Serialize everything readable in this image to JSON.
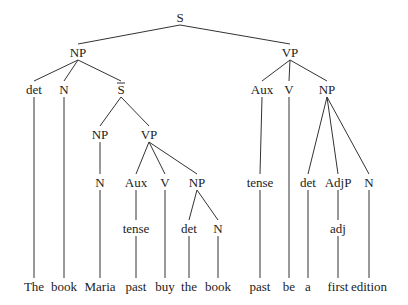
{
  "diagram": {
    "type": "syntax-tree",
    "sentence": [
      "The",
      "book",
      "Maria",
      "past",
      "buy",
      "the",
      "book",
      "past",
      "be",
      "a",
      "first",
      "edition"
    ],
    "nodes": [
      {
        "id": "s",
        "label": "S",
        "x": 180,
        "y": 18
      },
      {
        "id": "np1",
        "label": "NP",
        "x": 78,
        "y": 53
      },
      {
        "id": "vp1",
        "label": "VP",
        "x": 290,
        "y": 53
      },
      {
        "id": "det1",
        "label": "det",
        "x": 34,
        "y": 90
      },
      {
        "id": "n1",
        "label": "N",
        "x": 64,
        "y": 90
      },
      {
        "id": "sbar",
        "label": "S",
        "overline": true,
        "x": 121,
        "y": 90
      },
      {
        "id": "aux2",
        "label": "Aux",
        "x": 262,
        "y": 90
      },
      {
        "id": "v2",
        "label": "V",
        "x": 289,
        "y": 90
      },
      {
        "id": "np4",
        "label": "NP",
        "x": 327,
        "y": 90
      },
      {
        "id": "np2",
        "label": "NP",
        "x": 100,
        "y": 135
      },
      {
        "id": "vp2",
        "label": "VP",
        "x": 149,
        "y": 135
      },
      {
        "id": "n2",
        "label": "N",
        "x": 100,
        "y": 183
      },
      {
        "id": "aux1",
        "label": "Aux",
        "x": 136,
        "y": 183
      },
      {
        "id": "v1",
        "label": "V",
        "x": 165,
        "y": 183
      },
      {
        "id": "np3",
        "label": "NP",
        "x": 197,
        "y": 183
      },
      {
        "id": "tense2",
        "label": "tense",
        "x": 260,
        "y": 183
      },
      {
        "id": "det3",
        "label": "det",
        "x": 308,
        "y": 183
      },
      {
        "id": "adjp",
        "label": "AdjP",
        "x": 338,
        "y": 183
      },
      {
        "id": "n4",
        "label": "N",
        "x": 369,
        "y": 183
      },
      {
        "id": "tense1",
        "label": "tense",
        "x": 136,
        "y": 229
      },
      {
        "id": "det2",
        "label": "det",
        "x": 189,
        "y": 229
      },
      {
        "id": "n3",
        "label": "N",
        "x": 218,
        "y": 229
      },
      {
        "id": "adj",
        "label": "adj",
        "x": 338,
        "y": 229
      },
      {
        "id": "w1",
        "label": "The",
        "x": 34,
        "y": 287
      },
      {
        "id": "w2",
        "label": "book",
        "x": 64,
        "y": 287
      },
      {
        "id": "w3",
        "label": "Maria",
        "x": 100,
        "y": 287
      },
      {
        "id": "w4",
        "label": "past",
        "x": 136,
        "y": 287
      },
      {
        "id": "w5",
        "label": "buy",
        "x": 165,
        "y": 287
      },
      {
        "id": "w6",
        "label": "the",
        "x": 189,
        "y": 287
      },
      {
        "id": "w7",
        "label": "book",
        "x": 218,
        "y": 287
      },
      {
        "id": "w8",
        "label": "past",
        "x": 260,
        "y": 287
      },
      {
        "id": "w9",
        "label": "be",
        "x": 289,
        "y": 287
      },
      {
        "id": "w10",
        "label": "a",
        "x": 308,
        "y": 287
      },
      {
        "id": "w11",
        "label": "first",
        "x": 338,
        "y": 287
      },
      {
        "id": "w12",
        "label": "edition",
        "x": 369,
        "y": 287
      }
    ],
    "edges": [
      [
        "s",
        "np1"
      ],
      [
        "s",
        "vp1"
      ],
      [
        "np1",
        "det1"
      ],
      [
        "np1",
        "n1"
      ],
      [
        "np1",
        "sbar"
      ],
      [
        "vp1",
        "aux2"
      ],
      [
        "vp1",
        "v2"
      ],
      [
        "vp1",
        "np4"
      ],
      [
        "sbar",
        "np2"
      ],
      [
        "sbar",
        "vp2"
      ],
      [
        "np2",
        "n2"
      ],
      [
        "vp2",
        "aux1"
      ],
      [
        "vp2",
        "v1"
      ],
      [
        "vp2",
        "np3"
      ],
      [
        "aux1",
        "tense1"
      ],
      [
        "np3",
        "det2"
      ],
      [
        "np3",
        "n3"
      ],
      [
        "aux2",
        "tense2"
      ],
      [
        "np4",
        "det3"
      ],
      [
        "np4",
        "adjp"
      ],
      [
        "np4",
        "n4"
      ],
      [
        "adjp",
        "adj"
      ],
      [
        "det1",
        "w1"
      ],
      [
        "n1",
        "w2"
      ],
      [
        "n2",
        "w3"
      ],
      [
        "tense1",
        "w4"
      ],
      [
        "v1",
        "w5"
      ],
      [
        "det2",
        "w6"
      ],
      [
        "n3",
        "w7"
      ],
      [
        "tense2",
        "w8"
      ],
      [
        "v2",
        "w9"
      ],
      [
        "det3",
        "w10"
      ],
      [
        "adj",
        "w11"
      ],
      [
        "n4",
        "w12"
      ]
    ]
  }
}
